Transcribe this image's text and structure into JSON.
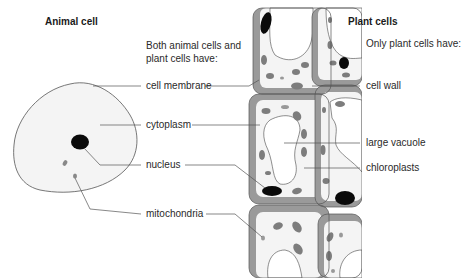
{
  "headings": {
    "animal": "Animal cell",
    "plant": "Plant cells"
  },
  "subheadings": {
    "both_line1": "Both animal cells and",
    "both_line2": "plant cells have:",
    "only_plant": "Only plant cells have:"
  },
  "labels": {
    "cell_membrane": "cell membrane",
    "cytoplasm": "cytoplasm",
    "nucleus": "nucleus",
    "mitochondria": "mitochondria",
    "cell_wall": "cell wall",
    "large_vacuole": "large vacuole",
    "chloroplasts": "chloroplasts"
  },
  "colors": {
    "cytoplasm_fill": "#f4f4f4",
    "cell_wall": "#9a9a9a",
    "chloroplast": "#7d7d7d",
    "nucleus": "#0a0a0a",
    "outline": "#444444",
    "leader_line": "#555555"
  }
}
